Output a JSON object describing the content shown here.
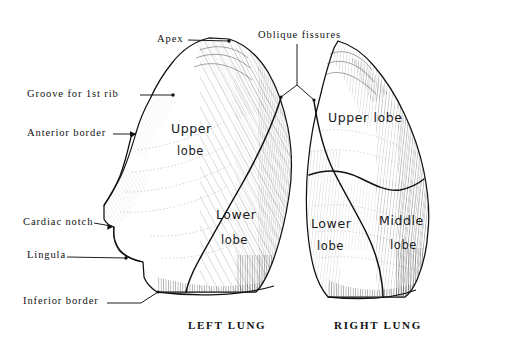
{
  "figure": {
    "background": "#ffffff",
    "ink": "#111111"
  },
  "callouts": [
    {
      "id": "apex",
      "label": "Apex",
      "x": 157,
      "y": 33,
      "leader": {
        "type": "line-dot",
        "from": [
          188,
          40
        ],
        "to": [
          229,
          41
        ]
      }
    },
    {
      "id": "groove-1st-rib",
      "label": "Groove for 1st rib",
      "x": 27,
      "y": 88,
      "leader": {
        "type": "line-dot",
        "from": [
          140,
          95
        ],
        "to": [
          173,
          95
        ]
      }
    },
    {
      "id": "anterior-border",
      "label": "Anterior border",
      "x": 27,
      "y": 127,
      "leader": {
        "type": "line-arrow",
        "from": [
          113,
          134
        ],
        "to": [
          136,
          134
        ]
      }
    },
    {
      "id": "cardiac-notch",
      "label": "Cardiac notch",
      "x": 23,
      "y": 216,
      "leader": {
        "type": "line-arrow",
        "from": [
          94,
          224
        ],
        "to": [
          114,
          226
        ]
      }
    },
    {
      "id": "lingula",
      "label": "Lingula",
      "x": 27,
      "y": 249,
      "leader": {
        "type": "line-dot",
        "from": [
          67,
          257
        ],
        "to": [
          126,
          258
        ]
      }
    },
    {
      "id": "inferior-border",
      "label": "Inferior border",
      "x": 23,
      "y": 295,
      "leader": {
        "type": "bent",
        "from": [
          107,
          303
        ],
        "mid": [
          141,
          303
        ],
        "to": [
          158,
          292
        ]
      }
    },
    {
      "id": "oblique-fissures",
      "label": "Oblique fissures",
      "x": 258,
      "y": 29,
      "leader": {
        "type": "fork",
        "stem": [
          [
            297,
            44
          ],
          [
            297,
            85
          ]
        ],
        "left": [
          281,
          98
        ],
        "right": [
          314,
          101
        ]
      }
    }
  ],
  "lung_labels": [
    {
      "id": "left-upper-lobe-1",
      "text": "Upper",
      "x": 171,
      "y": 121
    },
    {
      "id": "left-upper-lobe-2",
      "text": "lobe",
      "x": 177,
      "y": 144
    },
    {
      "id": "left-lower-lobe-1",
      "text": "Lower",
      "x": 216,
      "y": 207
    },
    {
      "id": "left-lower-lobe-2",
      "text": "lobe",
      "x": 221,
      "y": 233
    },
    {
      "id": "right-upper-lobe",
      "text": "Upper lobe",
      "x": 328,
      "y": 110
    },
    {
      "id": "right-lower-lobe-1",
      "text": "Lower",
      "x": 311,
      "y": 216
    },
    {
      "id": "right-lower-lobe-2",
      "text": "lobe",
      "x": 317,
      "y": 239
    },
    {
      "id": "right-middle-lobe-1",
      "text": "Middle",
      "x": 379,
      "y": 213
    },
    {
      "id": "right-middle-lobe-2",
      "text": "lobe",
      "x": 390,
      "y": 238
    }
  ],
  "captions": [
    {
      "id": "left-lung-caption",
      "text": "LEFT LUNG",
      "x": 188,
      "y": 319
    },
    {
      "id": "right-lung-caption",
      "text": "RIGHT LUNG",
      "x": 334,
      "y": 319
    }
  ]
}
